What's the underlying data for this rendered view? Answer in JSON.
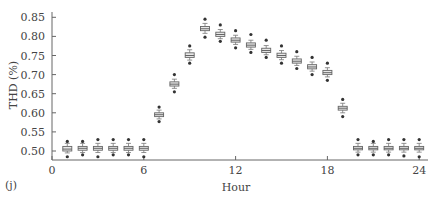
{
  "panel_label": "(j)",
  "chart_data": {
    "type": "box",
    "title": "",
    "xlabel": "Hour",
    "ylabel": "THD (%)",
    "xlim": [
      0,
      24.5
    ],
    "ylim": [
      0.48,
      0.86
    ],
    "x_ticks": [
      0,
      6,
      12,
      18,
      24
    ],
    "y_ticks": [
      0.5,
      0.55,
      0.6,
      0.65,
      0.7,
      0.75,
      0.8,
      0.85
    ],
    "y_tick_labels": [
      "0.50",
      "0.55",
      "0.60",
      "0.65",
      "0.70",
      "0.75",
      "0.80",
      "0.85"
    ],
    "grid": false,
    "legend": null,
    "categories": [
      1,
      2,
      3,
      4,
      5,
      6,
      7,
      8,
      9,
      10,
      11,
      12,
      13,
      14,
      15,
      16,
      17,
      18,
      19,
      20,
      21,
      22,
      23,
      24
    ],
    "median": [
      0.505,
      0.507,
      0.507,
      0.507,
      0.507,
      0.507,
      0.595,
      0.675,
      0.75,
      0.82,
      0.805,
      0.79,
      0.777,
      0.763,
      0.75,
      0.735,
      0.72,
      0.705,
      0.612,
      0.507,
      0.507,
      0.507,
      0.507,
      0.507
    ],
    "q1": [
      0.5,
      0.502,
      0.502,
      0.502,
      0.502,
      0.502,
      0.59,
      0.67,
      0.745,
      0.815,
      0.8,
      0.785,
      0.772,
      0.758,
      0.745,
      0.73,
      0.715,
      0.7,
      0.607,
      0.503,
      0.503,
      0.503,
      0.503,
      0.503
    ],
    "q3": [
      0.512,
      0.512,
      0.512,
      0.512,
      0.512,
      0.512,
      0.6,
      0.681,
      0.757,
      0.826,
      0.811,
      0.796,
      0.783,
      0.769,
      0.756,
      0.741,
      0.726,
      0.711,
      0.617,
      0.512,
      0.512,
      0.512,
      0.512,
      0.512
    ],
    "whisker_low": [
      0.495,
      0.496,
      0.496,
      0.496,
      0.496,
      0.496,
      0.584,
      0.664,
      0.738,
      0.808,
      0.794,
      0.779,
      0.766,
      0.752,
      0.739,
      0.724,
      0.709,
      0.694,
      0.6,
      0.497,
      0.497,
      0.497,
      0.497,
      0.497
    ],
    "whisker_high": [
      0.52,
      0.52,
      0.52,
      0.52,
      0.52,
      0.52,
      0.607,
      0.688,
      0.765,
      0.834,
      0.818,
      0.803,
      0.79,
      0.776,
      0.763,
      0.748,
      0.733,
      0.718,
      0.625,
      0.52,
      0.52,
      0.52,
      0.52,
      0.52
    ],
    "outlier_low": [
      0.485,
      0.49,
      0.485,
      0.49,
      0.49,
      0.485,
      0.577,
      0.655,
      0.73,
      0.798,
      0.787,
      0.77,
      0.758,
      0.745,
      0.73,
      0.716,
      0.7,
      0.685,
      0.59,
      0.49,
      0.49,
      0.49,
      0.487,
      0.485
    ],
    "outlier_high": [
      0.525,
      0.525,
      0.53,
      0.53,
      0.53,
      0.53,
      0.615,
      0.7,
      0.775,
      0.845,
      0.83,
      0.815,
      0.805,
      0.79,
      0.775,
      0.76,
      0.745,
      0.73,
      0.635,
      0.53,
      0.525,
      0.53,
      0.53,
      0.53
    ]
  }
}
